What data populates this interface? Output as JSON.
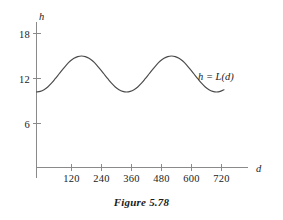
{
  "caption": "Figure 5.78",
  "chart_data": {
    "type": "line",
    "title": "",
    "subtitle": "",
    "xlabel": "d",
    "ylabel": "h",
    "xlim": [
      0,
      780
    ],
    "ylim": [
      0,
      20.5
    ],
    "grid": false,
    "legend_position": "inline-right",
    "annotations": [
      {
        "text": "h = L(d)",
        "x": 640,
        "y": 12.6
      }
    ],
    "xticks": [
      120,
      240,
      360,
      480,
      600,
      720
    ],
    "xtick_labels": [
      "120",
      "240",
      "360",
      "480",
      "600",
      "720"
    ],
    "yticks": [
      6,
      12,
      18
    ],
    "ytick_labels": [
      "6",
      "12",
      "18"
    ],
    "series": [
      {
        "name": "h = L(d)",
        "color": "#4a4a4a",
        "description": "sinusoidal curve, midline 12.6, amplitude 2.4, period 375, minimum at d=0",
        "x": [
          0,
          15,
          30,
          45,
          60,
          75,
          90,
          105,
          120,
          135,
          150,
          165,
          180,
          195,
          210,
          225,
          240,
          255,
          270,
          285,
          300,
          315,
          330,
          345,
          360,
          375,
          390,
          405,
          420,
          435,
          450,
          465,
          480,
          495,
          510,
          525,
          540,
          555,
          570,
          585,
          600,
          615,
          630,
          645,
          660,
          675,
          690,
          705,
          720,
          735,
          750
        ],
        "y": [
          10.2,
          10.28,
          10.5,
          10.87,
          11.37,
          11.97,
          12.6,
          13.23,
          13.83,
          14.33,
          14.7,
          14.92,
          15.0,
          14.92,
          14.7,
          14.33,
          13.83,
          13.23,
          12.6,
          11.97,
          11.37,
          10.87,
          10.5,
          10.28,
          10.2,
          10.28,
          10.5,
          10.87,
          11.37,
          11.97,
          12.6,
          13.23,
          13.83,
          14.33,
          14.7,
          14.92,
          15.0,
          14.92,
          14.7,
          14.33,
          13.83,
          13.23,
          12.6,
          11.97,
          11.37,
          10.87,
          10.5,
          10.28,
          10.2,
          10.28,
          10.5
        ]
      }
    ]
  }
}
